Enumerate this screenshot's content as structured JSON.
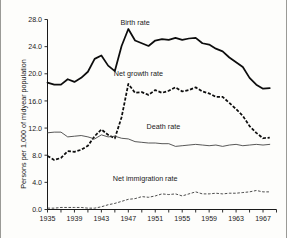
{
  "chart_data": {
    "type": "line",
    "title": "",
    "xlabel": "",
    "ylabel": "Persons per 1,000 of midyear population",
    "xlim": [
      1935,
      1969
    ],
    "ylim": [
      0.0,
      28.0
    ],
    "grid": false,
    "legend_position": "inline-annotations",
    "ytick_labels": [
      "0.0",
      "4.0",
      "8.0",
      "12.0",
      "16.0",
      "20.0",
      "24.0",
      "28.0"
    ],
    "ytick_values": [
      0.0,
      4.0,
      8.0,
      12.0,
      16.0,
      20.0,
      24.0,
      28.0
    ],
    "xtick_labels": [
      "1935",
      "1939",
      "1943",
      "1947",
      "1951",
      "1955",
      "1959",
      "1963",
      "1967"
    ],
    "xtick_values": [
      1935,
      1939,
      1943,
      1947,
      1951,
      1955,
      1959,
      1963,
      1967
    ],
    "xtick_minor_interval": 2,
    "x": [
      1935,
      1936,
      1937,
      1938,
      1939,
      1940,
      1941,
      1942,
      1943,
      1944,
      1945,
      1946,
      1947,
      1948,
      1949,
      1950,
      1951,
      1952,
      1953,
      1954,
      1955,
      1956,
      1957,
      1958,
      1959,
      1960,
      1961,
      1962,
      1963,
      1964,
      1965,
      1966,
      1967,
      1968
    ],
    "series": [
      {
        "name": "Birth rate",
        "style": "solid-thick",
        "label_x": 1948.0,
        "label_y": 27.2,
        "values": [
          18.7,
          18.4,
          18.4,
          19.2,
          18.8,
          19.4,
          20.3,
          22.2,
          22.7,
          21.2,
          20.4,
          24.1,
          26.6,
          24.9,
          24.5,
          24.1,
          24.9,
          25.1,
          25.0,
          25.3,
          25.0,
          25.2,
          25.3,
          24.5,
          24.3,
          23.7,
          23.3,
          22.4,
          21.7,
          21.0,
          19.4,
          18.4,
          17.8,
          17.9
        ],
        "annotations": []
      },
      {
        "name": "Net growth rate",
        "style": "dashed-thick",
        "label_x": 1948.5,
        "label_y": 19.7,
        "values": [
          7.9,
          7.3,
          7.6,
          8.6,
          8.5,
          8.8,
          9.4,
          10.8,
          11.8,
          11.0,
          10.5,
          13.6,
          18.5,
          17.2,
          17.3,
          16.9,
          17.6,
          17.2,
          17.5,
          18.0,
          17.4,
          17.6,
          18.0,
          17.4,
          17.1,
          16.6,
          16.6,
          15.7,
          14.8,
          13.8,
          12.3,
          11.3,
          10.5,
          10.6
        ],
        "annotations": []
      },
      {
        "name": "Death rate",
        "style": "solid-thin",
        "label_x": 1952.2,
        "label_y": 11.9,
        "values": [
          11.3,
          11.4,
          11.4,
          10.7,
          10.8,
          10.9,
          10.7,
          10.4,
          11.0,
          10.7,
          10.8,
          10.5,
          10.4,
          10.0,
          9.9,
          9.8,
          9.8,
          9.7,
          9.7,
          9.3,
          9.4,
          9.5,
          9.6,
          9.5,
          9.4,
          9.5,
          9.3,
          9.5,
          9.6,
          9.4,
          9.5,
          9.6,
          9.5,
          9.6
        ],
        "annotations": []
      },
      {
        "name": "Net immigration rate",
        "style": "dashed-thin",
        "label_x": 1949.5,
        "label_y": 4.2,
        "values": [
          0.2,
          0.2,
          0.3,
          0.3,
          0.3,
          0.3,
          0.2,
          0.2,
          0.4,
          0.7,
          0.9,
          1.2,
          1.5,
          1.6,
          1.9,
          1.8,
          2.0,
          2.3,
          2.2,
          2.3,
          2.0,
          2.3,
          2.6,
          2.3,
          2.3,
          2.4,
          2.3,
          2.4,
          2.4,
          2.5,
          2.6,
          2.8,
          2.6,
          2.6
        ],
        "annotations": []
      }
    ]
  },
  "figure": {
    "frame_color": "#9a9a96",
    "background": "#fdfdfb",
    "ink_color": "#0d0d0d"
  }
}
